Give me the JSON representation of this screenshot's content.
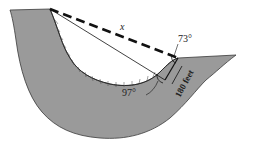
{
  "diagram": {
    "labels": {
      "distance": "x",
      "angle_top": "73°",
      "angle_bottom": "97°",
      "side_length": "180 feet"
    },
    "colors": {
      "terrain": "#9a9a9a",
      "terrain_edge": "#3a3a3a",
      "lines": "#111111",
      "background": "#ffffff"
    }
  }
}
